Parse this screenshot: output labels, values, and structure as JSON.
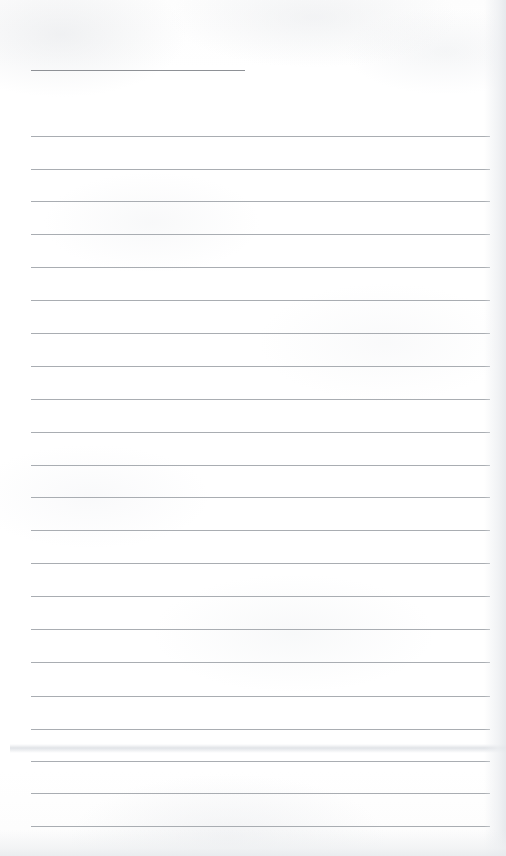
{
  "document": {
    "kind": "scanned-lined-notebook-page",
    "title": "Blank ruled notebook page",
    "page_width": 506,
    "page_height": 856,
    "background_color": "#fefefe",
    "has_handwriting": false,
    "has_printed_text": false,
    "visible_text": ""
  },
  "ruling": {
    "rule_color": "#a9adb2",
    "header_rule_color": "#8e9196",
    "left_margin_x": 31,
    "right_margin_x": 490,
    "line_spacing_px": 32.85,
    "full_rule_count": 22,
    "header_rule_count": 1
  },
  "header_rule": {
    "label": "header-rule",
    "y": 70,
    "x_start": 31,
    "x_end": 245,
    "length": 214,
    "thickness": 1.4,
    "color": "#8e9196"
  },
  "rules": [
    {
      "index": 1,
      "y": 136,
      "x_start": 31,
      "x_end": 490
    },
    {
      "index": 2,
      "y": 169,
      "x_start": 31,
      "x_end": 490
    },
    {
      "index": 3,
      "y": 201,
      "x_start": 31,
      "x_end": 490
    },
    {
      "index": 4,
      "y": 234,
      "x_start": 31,
      "x_end": 490
    },
    {
      "index": 5,
      "y": 267,
      "x_start": 31,
      "x_end": 490
    },
    {
      "index": 6,
      "y": 300,
      "x_start": 31,
      "x_end": 490
    },
    {
      "index": 7,
      "y": 333,
      "x_start": 31,
      "x_end": 490
    },
    {
      "index": 8,
      "y": 366,
      "x_start": 31,
      "x_end": 490
    },
    {
      "index": 9,
      "y": 399,
      "x_start": 31,
      "x_end": 490
    },
    {
      "index": 10,
      "y": 432,
      "x_start": 31,
      "x_end": 490
    },
    {
      "index": 11,
      "y": 465,
      "x_start": 31,
      "x_end": 490
    },
    {
      "index": 12,
      "y": 497,
      "x_start": 31,
      "x_end": 490
    },
    {
      "index": 13,
      "y": 530,
      "x_start": 31,
      "x_end": 490
    },
    {
      "index": 14,
      "y": 563,
      "x_start": 31,
      "x_end": 490
    },
    {
      "index": 15,
      "y": 596,
      "x_start": 31,
      "x_end": 490
    },
    {
      "index": 16,
      "y": 629,
      "x_start": 31,
      "x_end": 490
    },
    {
      "index": 17,
      "y": 662,
      "x_start": 31,
      "x_end": 490
    },
    {
      "index": 18,
      "y": 696,
      "x_start": 31,
      "x_end": 490
    },
    {
      "index": 19,
      "y": 729,
      "x_start": 31,
      "x_end": 490
    },
    {
      "index": 20,
      "y": 761,
      "x_start": 31,
      "x_end": 490
    },
    {
      "index": 21,
      "y": 793,
      "x_start": 31,
      "x_end": 490
    },
    {
      "index": 22,
      "y": 826,
      "x_start": 31,
      "x_end": 490
    }
  ],
  "artifacts": {
    "smudge_band": {
      "y": 744,
      "height": 9,
      "color": "#dbdee3"
    },
    "right_edge_shadow": {
      "width": 22,
      "color": "#e4e7eb"
    },
    "bottom_edge_shadow": {
      "height": 26,
      "color": "#e7eaed"
    }
  }
}
